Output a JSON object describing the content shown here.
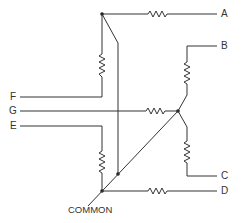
{
  "diagram": {
    "type": "resistor network schematic",
    "terminals": {
      "A": "A",
      "B": "B",
      "C": "C",
      "D": "D",
      "E": "E",
      "F": "F",
      "G": "G"
    },
    "common_label": "COMMON",
    "stroke_color": "#333333",
    "background": "#ffffff"
  }
}
